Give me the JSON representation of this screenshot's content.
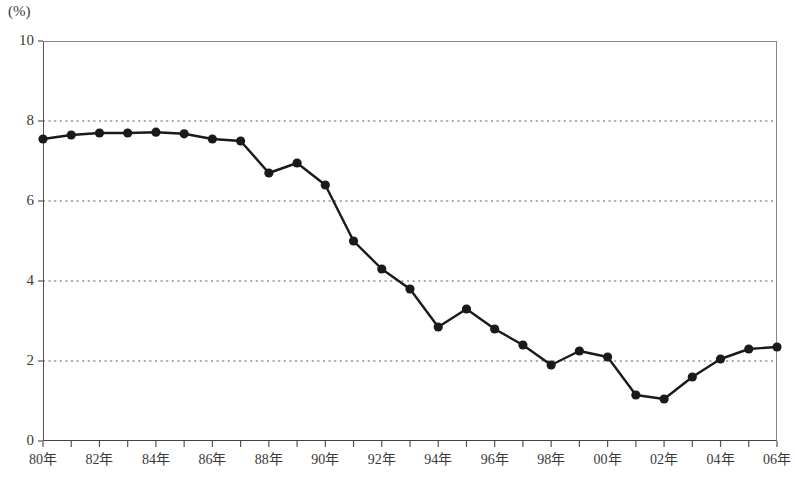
{
  "chart_data": {
    "type": "line",
    "title": "",
    "subtitle": "",
    "xlabel": "",
    "ylabel": "",
    "unit_label": "(%)",
    "grid": "horizontal-dotted",
    "legend": "none",
    "ylim": [
      0,
      10
    ],
    "yticks": [
      0,
      2,
      4,
      6,
      8,
      10
    ],
    "ytick_labels": [
      "0",
      "2",
      "4",
      "6",
      "8",
      "10"
    ],
    "gridlines": [
      2,
      4,
      6,
      8
    ],
    "xlim": [
      1980,
      2006
    ],
    "xticks_all_years": [
      1980,
      1981,
      1982,
      1983,
      1984,
      1985,
      1986,
      1987,
      1988,
      1989,
      1990,
      1991,
      1992,
      1993,
      1994,
      1995,
      1996,
      1997,
      1998,
      1999,
      2000,
      2001,
      2002,
      2003,
      2004,
      2005,
      2006
    ],
    "xtick_labels": [
      {
        "x": 1980,
        "label": "80年"
      },
      {
        "x": 1982,
        "label": "82年"
      },
      {
        "x": 1984,
        "label": "84年"
      },
      {
        "x": 1986,
        "label": "86年"
      },
      {
        "x": 1988,
        "label": "88年"
      },
      {
        "x": 1990,
        "label": "90年"
      },
      {
        "x": 1992,
        "label": "92年"
      },
      {
        "x": 1994,
        "label": "94年"
      },
      {
        "x": 1996,
        "label": "96年"
      },
      {
        "x": 1998,
        "label": "98年"
      },
      {
        "x": 2000,
        "label": "00年"
      },
      {
        "x": 2002,
        "label": "02年"
      },
      {
        "x": 2004,
        "label": "04年"
      },
      {
        "x": 2006,
        "label": "06年"
      }
    ],
    "x": [
      1980,
      1981,
      1982,
      1983,
      1984,
      1985,
      1986,
      1987,
      1988,
      1989,
      1990,
      1991,
      1992,
      1993,
      1994,
      1995,
      1996,
      1997,
      1998,
      1999,
      2000,
      2001,
      2002,
      2003,
      2004,
      2005,
      2006
    ],
    "series": [
      {
        "name": "",
        "marker": "filled-circle",
        "color": "#1a1a1a",
        "values": [
          7.55,
          7.65,
          7.7,
          7.7,
          7.72,
          7.68,
          7.55,
          7.5,
          6.7,
          6.95,
          6.4,
          5.0,
          4.3,
          3.8,
          2.85,
          3.3,
          2.8,
          2.4,
          1.9,
          2.25,
          2.1,
          1.15,
          1.05,
          1.6,
          2.05,
          2.3,
          2.35
        ]
      }
    ]
  },
  "colors": {
    "line": "#1a1a1a",
    "marker": "#1a1a1a",
    "axis": "#555555",
    "frame": "#888888",
    "grid": "#555555",
    "text": "#3a3a3a",
    "background": "#ffffff"
  }
}
